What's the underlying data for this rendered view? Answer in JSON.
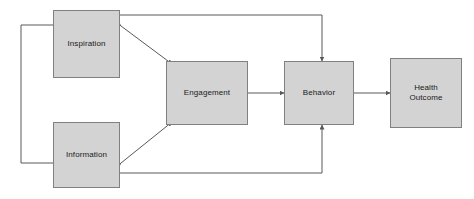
{
  "diagram": {
    "background_color": "#ffffff",
    "node_fill_color": "#d3d3d3",
    "node_border_color": "#808080",
    "connector_color": "#595959",
    "nodes": [
      {
        "id": "inspiration",
        "label": "Inspiration"
      },
      {
        "id": "information",
        "label": "Information"
      },
      {
        "id": "engagement",
        "label": "Engagement"
      },
      {
        "id": "behavior",
        "label": "Behavior"
      },
      {
        "id": "health",
        "label": "Health\nOutcome"
      }
    ],
    "connectors": [
      {
        "id": "inspiration-information-link",
        "from": "inspiration",
        "to": "information",
        "style": "elbow",
        "arrowheads": "none"
      },
      {
        "id": "inspiration-behavior",
        "from": "inspiration",
        "to": "behavior",
        "style": "elbow",
        "arrowheads": "end"
      },
      {
        "id": "information-behavior",
        "from": "information",
        "to": "behavior",
        "style": "elbow",
        "arrowheads": "end"
      },
      {
        "id": "inspiration-engagement",
        "from": "inspiration",
        "to": "engagement",
        "style": "diagonal",
        "arrowheads": "both"
      },
      {
        "id": "information-engagement",
        "from": "information",
        "to": "engagement",
        "style": "diagonal",
        "arrowheads": "both"
      },
      {
        "id": "engagement-behavior",
        "from": "engagement",
        "to": "behavior",
        "style": "straight",
        "arrowheads": "end"
      },
      {
        "id": "behavior-health",
        "from": "behavior",
        "to": "health",
        "style": "straight",
        "arrowheads": "end"
      }
    ]
  }
}
